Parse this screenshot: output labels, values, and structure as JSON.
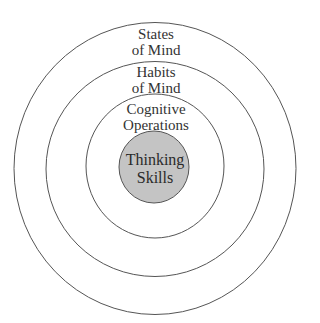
{
  "diagram": {
    "type": "concentric-circles",
    "colors": {
      "stroke": "#555555",
      "core_fill": "#c4c4c4",
      "background": "#ffffff",
      "text": "#333333"
    },
    "rings": [
      {
        "id": "states-of-mind",
        "line1": "States",
        "line2": "of Mind"
      },
      {
        "id": "habits-of-mind",
        "line1": "Habits",
        "line2": "of Mind"
      },
      {
        "id": "cognitive-operations",
        "line1": "Cognitive",
        "line2": "Operations"
      },
      {
        "id": "thinking-skills",
        "line1": "Thinking",
        "line2": "Skills"
      }
    ]
  }
}
